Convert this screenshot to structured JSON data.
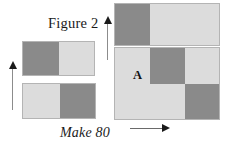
{
  "figure": {
    "title": "Figure 2",
    "instruction": "Make 80",
    "region_label": "A",
    "colors": {
      "dark": "#8a8a8a",
      "light": "#dcdcdc",
      "outline": "#b4b4b4",
      "arrow": "#1a1a1a",
      "background": "#ffffff",
      "text": "#1a1a1a"
    },
    "shapes": [
      {
        "name": "left-upper-rectangle",
        "description": "Two-part rectangle, dark left half and light right half",
        "parts": [
          {
            "fill": "dark",
            "x": 23,
            "y": 42,
            "w": 36,
            "h": 33
          },
          {
            "fill": "light",
            "x": 59,
            "y": 42,
            "w": 35,
            "h": 33
          }
        ]
      },
      {
        "name": "left-lower-rectangle",
        "description": "Two-part rectangle, light left half and dark right half",
        "parts": [
          {
            "fill": "light",
            "x": 23,
            "y": 84,
            "w": 37,
            "h": 34
          },
          {
            "fill": "dark",
            "x": 60,
            "y": 84,
            "w": 35,
            "h": 34
          }
        ]
      },
      {
        "name": "right-upper-rectangle",
        "description": "Wide rectangle, narrow dark band at left and large light area at right",
        "parts": [
          {
            "fill": "dark",
            "x": 115,
            "y": 4,
            "w": 35,
            "h": 41
          },
          {
            "fill": "light",
            "x": 150,
            "y": 4,
            "w": 69,
            "h": 41
          }
        ]
      },
      {
        "name": "right-lower-rectangle",
        "description": "Large rectangle: light left column plus a 2x2 checkerboard of dark and light squares",
        "parts": [
          {
            "fill": "light",
            "x": 115,
            "y": 48,
            "w": 35,
            "h": 71
          },
          {
            "fill": "dark",
            "x": 150,
            "y": 48,
            "w": 35,
            "h": 36
          },
          {
            "fill": "light",
            "x": 185,
            "y": 48,
            "w": 34,
            "h": 36
          },
          {
            "fill": "light",
            "x": 150,
            "y": 84,
            "w": 35,
            "h": 35
          },
          {
            "fill": "dark",
            "x": 185,
            "y": 84,
            "w": 34,
            "h": 35
          }
        ]
      }
    ],
    "arrows": [
      {
        "name": "left-vertical-arrow",
        "direction": "up",
        "x": 12,
        "y": 67,
        "length": 43
      },
      {
        "name": "middle-vertical-arrow",
        "direction": "up",
        "x": 107,
        "y": 22,
        "length": 38
      },
      {
        "name": "bottom-horizontal-arrow",
        "direction": "right",
        "x": 130,
        "y": 128,
        "length": 33
      }
    ]
  }
}
